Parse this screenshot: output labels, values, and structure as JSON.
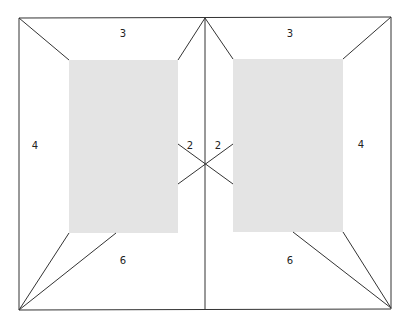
{
  "diagram": {
    "type": "two-page spread margin proportions",
    "colors": {
      "background": "#ffffff",
      "line": "#333333",
      "text_block": "#e4e4e4",
      "label": "#222222"
    },
    "spread": {
      "left": 19,
      "top": 18,
      "right": 391,
      "bottom": 309,
      "gutter_x": 205
    },
    "pages": [
      {
        "side": "left",
        "text_block": {
          "x": 69,
          "y": 60,
          "width": 109,
          "height": 173
        },
        "margins": {
          "head": "3",
          "outer": "4",
          "inner": "2",
          "foot": "6"
        }
      },
      {
        "side": "right",
        "text_block": {
          "x": 233,
          "y": 59,
          "width": 110,
          "height": 173
        },
        "margins": {
          "head": "3",
          "outer": "4",
          "inner": "2",
          "foot": "6"
        }
      }
    ]
  }
}
